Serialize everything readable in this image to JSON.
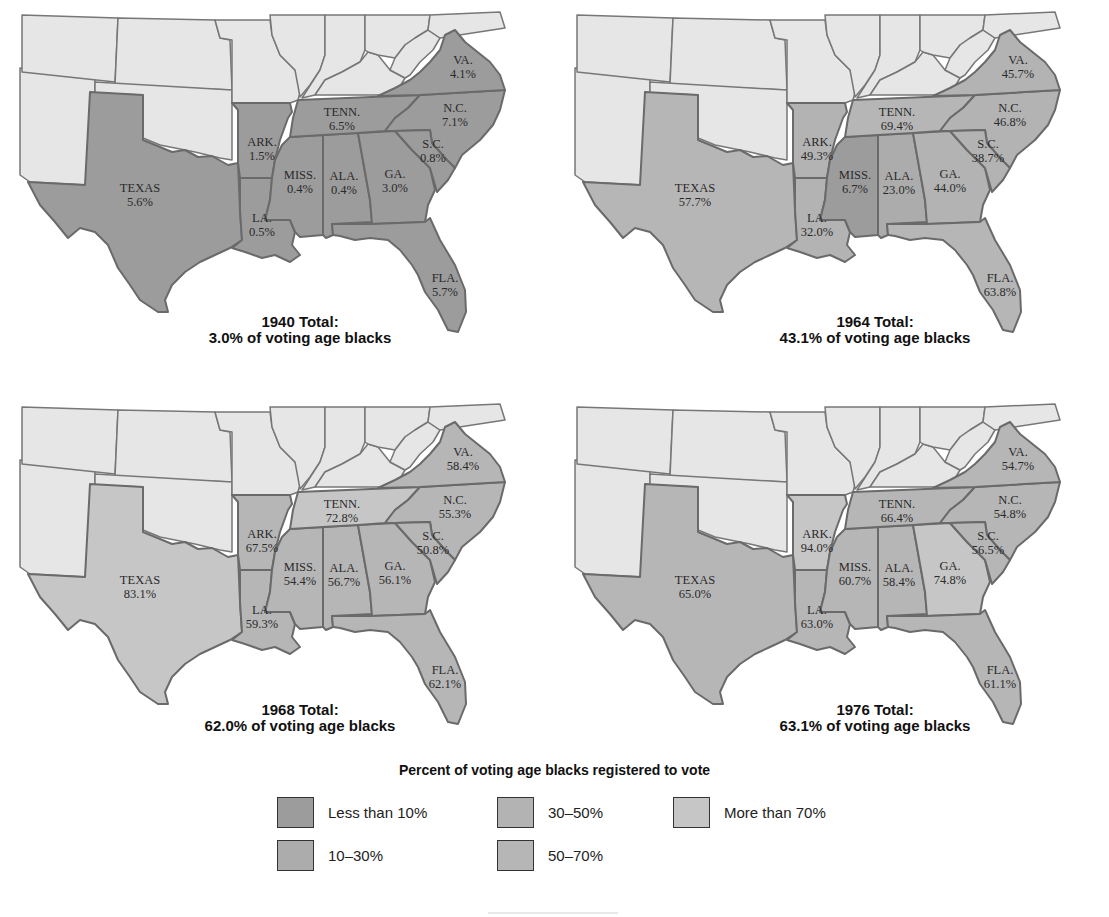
{
  "colors": {
    "lt10": "#9c9c9c",
    "10to30": "#acacac",
    "30to50": "#b3b3b3",
    "50to70": "#b6b6b6",
    "gt70": "#c6c6c6",
    "other_state": "#e6e6e6",
    "border": "#666666"
  },
  "legend": {
    "title": "Percent of voting age blacks registered to vote",
    "items": [
      {
        "key": "lt10",
        "label": "Less than 10%"
      },
      {
        "key": "10to30",
        "label": "10–30%"
      },
      {
        "key": "30to50",
        "label": "30–50%"
      },
      {
        "key": "50to70",
        "label": "50–70%"
      },
      {
        "key": "gt70",
        "label": "More than 70%"
      }
    ]
  },
  "maps": [
    {
      "year": "1940",
      "caption_line1": "1940 Total:",
      "caption_line2": "3.0% of voting age blacks",
      "states": {
        "texas": {
          "name": "TEXAS",
          "value": "5.6%",
          "cat": "lt10"
        },
        "ark": {
          "name": "ARK.",
          "value": "1.5%",
          "cat": "lt10"
        },
        "la": {
          "name": "LA.",
          "value": "0.5%",
          "cat": "lt10"
        },
        "miss": {
          "name": "MISS.",
          "value": "0.4%",
          "cat": "lt10"
        },
        "ala": {
          "name": "ALA.",
          "value": "0.4%",
          "cat": "lt10"
        },
        "ga": {
          "name": "GA.",
          "value": "3.0%",
          "cat": "lt10"
        },
        "fla": {
          "name": "FLA.",
          "value": "5.7%",
          "cat": "lt10"
        },
        "tenn": {
          "name": "TENN.",
          "value": "6.5%",
          "cat": "lt10"
        },
        "nc": {
          "name": "N.C.",
          "value": "7.1%",
          "cat": "lt10"
        },
        "sc": {
          "name": "S.C.",
          "value": "0.8%",
          "cat": "lt10"
        },
        "va": {
          "name": "VA.",
          "value": "4.1%",
          "cat": "lt10"
        }
      }
    },
    {
      "year": "1964",
      "caption_line1": "1964 Total:",
      "caption_line2": "43.1% of voting age blacks",
      "states": {
        "texas": {
          "name": "TEXAS",
          "value": "57.7%",
          "cat": "50to70"
        },
        "ark": {
          "name": "ARK.",
          "value": "49.3%",
          "cat": "30to50"
        },
        "la": {
          "name": "LA.",
          "value": "32.0%",
          "cat": "30to50"
        },
        "miss": {
          "name": "MISS.",
          "value": "6.7%",
          "cat": "lt10"
        },
        "ala": {
          "name": "ALA.",
          "value": "23.0%",
          "cat": "10to30"
        },
        "ga": {
          "name": "GA.",
          "value": "44.0%",
          "cat": "30to50"
        },
        "fla": {
          "name": "FLA.",
          "value": "63.8%",
          "cat": "50to70"
        },
        "tenn": {
          "name": "TENN.",
          "value": "69.4%",
          "cat": "50to70"
        },
        "nc": {
          "name": "N.C.",
          "value": "46.8%",
          "cat": "30to50"
        },
        "sc": {
          "name": "S.C.",
          "value": "38.7%",
          "cat": "30to50"
        },
        "va": {
          "name": "VA.",
          "value": "45.7%",
          "cat": "30to50"
        }
      }
    },
    {
      "year": "1968",
      "caption_line1": "1968 Total:",
      "caption_line2": "62.0% of voting age blacks",
      "states": {
        "texas": {
          "name": "TEXAS",
          "value": "83.1%",
          "cat": "gt70"
        },
        "ark": {
          "name": "ARK.",
          "value": "67.5%",
          "cat": "50to70"
        },
        "la": {
          "name": "LA.",
          "value": "59.3%",
          "cat": "50to70"
        },
        "miss": {
          "name": "MISS.",
          "value": "54.4%",
          "cat": "50to70"
        },
        "ala": {
          "name": "ALA.",
          "value": "56.7%",
          "cat": "50to70"
        },
        "ga": {
          "name": "GA.",
          "value": "56.1%",
          "cat": "50to70"
        },
        "fla": {
          "name": "FLA.",
          "value": "62.1%",
          "cat": "50to70"
        },
        "tenn": {
          "name": "TENN.",
          "value": "72.8%",
          "cat": "gt70"
        },
        "nc": {
          "name": "N.C.",
          "value": "55.3%",
          "cat": "50to70"
        },
        "sc": {
          "name": "S.C.",
          "value": "50.8%",
          "cat": "50to70"
        },
        "va": {
          "name": "VA.",
          "value": "58.4%",
          "cat": "50to70"
        }
      }
    },
    {
      "year": "1976",
      "caption_line1": "1976 Total:",
      "caption_line2": "63.1% of voting age blacks",
      "states": {
        "texas": {
          "name": "TEXAS",
          "value": "65.0%",
          "cat": "50to70"
        },
        "ark": {
          "name": "ARK.",
          "value": "94.0%",
          "cat": "gt70"
        },
        "la": {
          "name": "LA.",
          "value": "63.0%",
          "cat": "50to70"
        },
        "miss": {
          "name": "MISS.",
          "value": "60.7%",
          "cat": "50to70"
        },
        "ala": {
          "name": "ALA.",
          "value": "58.4%",
          "cat": "50to70"
        },
        "ga": {
          "name": "GA.",
          "value": "74.8%",
          "cat": "gt70"
        },
        "fla": {
          "name": "FLA.",
          "value": "61.1%",
          "cat": "50to70"
        },
        "tenn": {
          "name": "TENN.",
          "value": "66.4%",
          "cat": "50to70"
        },
        "nc": {
          "name": "N.C.",
          "value": "54.8%",
          "cat": "50to70"
        },
        "sc": {
          "name": "S.C.",
          "value": "56.5%",
          "cat": "50to70"
        },
        "va": {
          "name": "VA.",
          "value": "54.7%",
          "cat": "50to70"
        }
      }
    }
  ]
}
